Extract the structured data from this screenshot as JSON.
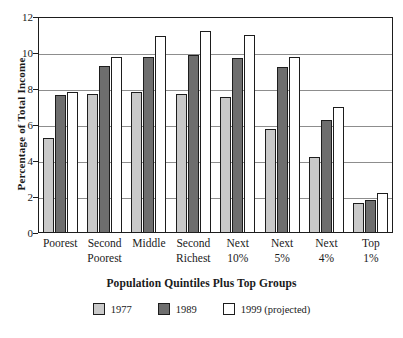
{
  "chart_data": {
    "type": "bar",
    "title": "",
    "xlabel": "Population Quintiles Plus Top Groups",
    "ylabel": "Percentage of  Total Income",
    "ylim": [
      0,
      12
    ],
    "yticks": [
      0,
      2,
      4,
      6,
      8,
      10,
      12
    ],
    "ytick_labels": [
      "0",
      "2",
      "4",
      "6",
      "8",
      "10",
      "12"
    ],
    "grid": true,
    "legend_position": "bottom",
    "categories": [
      "Poorest",
      "Second Poorest",
      "Middle",
      "Second Richest",
      "Next 10%",
      "Next 5%",
      "Next 4%",
      "Top 1%"
    ],
    "category_lines": [
      {
        "l1": "Poorest",
        "l2": ""
      },
      {
        "l1": "Second",
        "l2": "Poorest"
      },
      {
        "l1": "Middle",
        "l2": ""
      },
      {
        "l1": "Second",
        "l2": "Richest"
      },
      {
        "l1": "Next",
        "l2": "10%"
      },
      {
        "l1": "Next",
        "l2": "5%"
      },
      {
        "l1": "Next",
        "l2": "4%"
      },
      {
        "l1": "Top",
        "l2": "1%"
      }
    ],
    "series": [
      {
        "name": "1977",
        "color": "#c9c9c9",
        "values": [
          5.3,
          7.75,
          7.85,
          7.75,
          7.55,
          5.8,
          4.2,
          1.65
        ]
      },
      {
        "name": "1989",
        "color": "#6e6e6e",
        "values": [
          7.65,
          9.3,
          9.8,
          9.9,
          9.7,
          9.25,
          6.3,
          1.85
        ]
      },
      {
        "name": "1999 (projected)",
        "color": "#ffffff",
        "values": [
          7.85,
          9.8,
          10.95,
          11.25,
          11.0,
          9.8,
          7.0,
          2.25
        ]
      }
    ]
  },
  "legend": {
    "items": [
      {
        "label": "1977",
        "swatch": "#c9c9c9"
      },
      {
        "label": "1989",
        "swatch": "#6e6e6e"
      },
      {
        "label": "1999 (projected)",
        "swatch": "#ffffff"
      }
    ]
  }
}
